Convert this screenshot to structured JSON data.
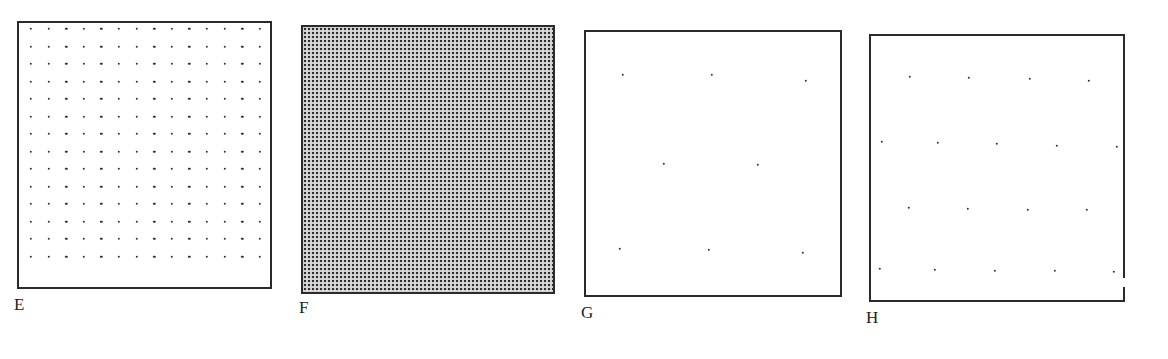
{
  "figure": {
    "panels": [
      {
        "id": "E",
        "label": "E",
        "box": {
          "x": 17,
          "y": 21,
          "w": 255,
          "h": 268
        },
        "pattern": "regular-square-dot-grid",
        "grid": {
          "cols": 14,
          "rows": 14,
          "x0": 31,
          "y0": 29,
          "dx": 17.6,
          "dy": 17.5
        },
        "label_pos": {
          "x": 14,
          "y": 296
        }
      },
      {
        "id": "F",
        "label": "F",
        "box": {
          "x": 301,
          "y": 25,
          "w": 254,
          "h": 269
        },
        "pattern": "dense-halftone",
        "label_pos": {
          "x": 299,
          "y": 299
        }
      },
      {
        "id": "G",
        "label": "G",
        "box": {
          "x": 584,
          "y": 30,
          "w": 258,
          "h": 267
        },
        "pattern": "sparse-staggered-dots",
        "dots": [
          [
            623,
            75
          ],
          [
            712,
            75
          ],
          [
            806,
            81
          ],
          [
            664,
            164
          ],
          [
            758,
            165
          ],
          [
            620,
            249
          ],
          [
            709,
            250
          ],
          [
            803,
            253
          ]
        ],
        "label_pos": {
          "x": 581,
          "y": 304
        }
      },
      {
        "id": "H",
        "label": "H",
        "box": {
          "x": 869,
          "y": 34,
          "w": 256,
          "h": 268
        },
        "pattern": "staggered-dot-lattice",
        "dots": [
          [
            910,
            77
          ],
          [
            969,
            78
          ],
          [
            1030,
            79
          ],
          [
            1089,
            81
          ],
          [
            882,
            142
          ],
          [
            938,
            143
          ],
          [
            997,
            144
          ],
          [
            1057,
            146
          ],
          [
            1117,
            147
          ],
          [
            909,
            208
          ],
          [
            968,
            209
          ],
          [
            1028,
            210
          ],
          [
            1087,
            210
          ],
          [
            880,
            269
          ],
          [
            935,
            270
          ],
          [
            995,
            271
          ],
          [
            1055,
            271
          ],
          [
            1114,
            272
          ]
        ],
        "right_edge_gap": {
          "y": 278,
          "h": 9
        },
        "label_pos": {
          "x": 866,
          "y": 309
        }
      }
    ]
  }
}
